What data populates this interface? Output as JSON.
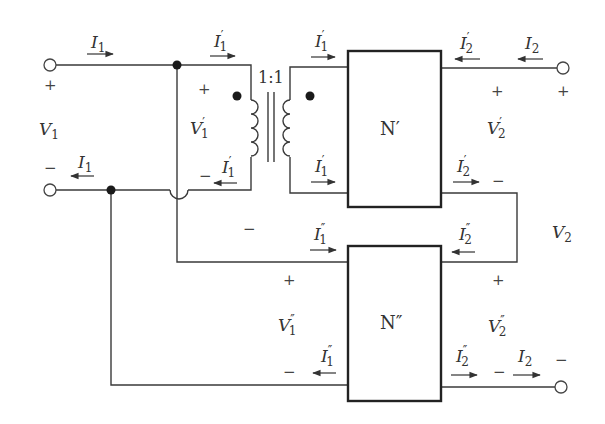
{
  "diagram": {
    "type": "two-port series-parallel interconnection with ideal transformer",
    "transformer": {
      "ratio": "1:1"
    },
    "networks": [
      {
        "id": "N1",
        "label": "N′"
      },
      {
        "id": "N2",
        "label": "N″"
      }
    ],
    "labels": {
      "I1_top": {
        "main": "I",
        "sub": "1",
        "prime": ""
      },
      "I1_bot": {
        "main": "I",
        "sub": "1",
        "prime": ""
      },
      "V1": {
        "main": "V",
        "sub": "1",
        "prime": ""
      },
      "I1p_a": {
        "main": "I",
        "sub": "1",
        "prime": "′"
      },
      "I1p_b": {
        "main": "I",
        "sub": "1",
        "prime": "′"
      },
      "I1p_c": {
        "main": "I",
        "sub": "1",
        "prime": "′"
      },
      "I1p_d": {
        "main": "I",
        "sub": "1",
        "prime": "′"
      },
      "V1p": {
        "main": "V",
        "sub": "1",
        "prime": "′"
      },
      "I2p_a": {
        "main": "I",
        "sub": "2",
        "prime": "′"
      },
      "I2p_b": {
        "main": "I",
        "sub": "2",
        "prime": "′"
      },
      "I2_top": {
        "main": "I",
        "sub": "2",
        "prime": ""
      },
      "V2p": {
        "main": "V",
        "sub": "2",
        "prime": "′"
      },
      "V2": {
        "main": "V",
        "sub": "2",
        "prime": ""
      },
      "I1pp_a": {
        "main": "I",
        "sub": "1",
        "prime": "″"
      },
      "I1pp_b": {
        "main": "I",
        "sub": "1",
        "prime": "″"
      },
      "V1pp": {
        "main": "V",
        "sub": "1",
        "prime": "″"
      },
      "I2pp_a": {
        "main": "I",
        "sub": "2",
        "prime": "″"
      },
      "I2pp_b": {
        "main": "I",
        "sub": "2",
        "prime": "″"
      },
      "V2pp": {
        "main": "V",
        "sub": "2",
        "prime": "″"
      },
      "I2_bot": {
        "main": "I",
        "sub": "2",
        "prime": ""
      }
    },
    "signs": {
      "plus": "+",
      "minus": "−"
    }
  }
}
